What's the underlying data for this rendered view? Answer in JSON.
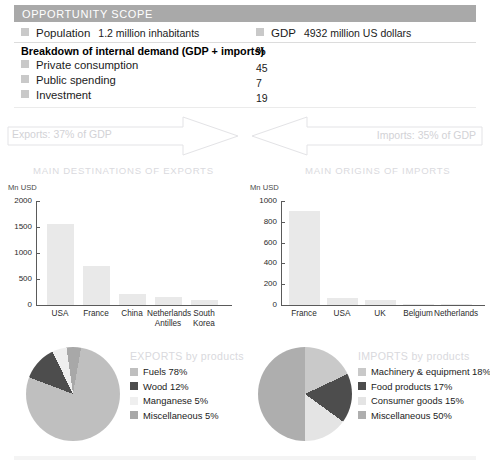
{
  "header": {
    "title": "OPPORTUNITY SCOPE",
    "bar_color": "#a9a9a9"
  },
  "stats": {
    "population": {
      "label": "Population",
      "value": "1.2 million inhabitants"
    },
    "gdp": {
      "label": "GDP",
      "value": "4932 million US dollars"
    }
  },
  "breakdown": {
    "title": "Breakdown of internal demand (GDP + imports)",
    "unit_header": "%",
    "rows": [
      {
        "label": "Private consumption",
        "value": "45"
      },
      {
        "label": "Public spending",
        "value": "7"
      },
      {
        "label": "Investment",
        "value": "19"
      }
    ]
  },
  "flows": {
    "exports_label": "Exports: 37% of GDP",
    "imports_label": "Imports: 35% of GDP"
  },
  "sections": {
    "exports_chart_title": "MAIN DESTINATIONS OF EXPORTS",
    "imports_chart_title": "MAIN ORIGINS OF IMPORTS"
  },
  "chart_data": [
    {
      "type": "bar",
      "title": "MAIN DESTINATIONS OF EXPORTS",
      "xlabel": "",
      "ylabel": "Mn USD",
      "ylim": [
        0,
        2000
      ],
      "yticks": [
        0,
        500,
        1000,
        1500,
        2000
      ],
      "ytick_labels": [
        "0",
        "500",
        "1000",
        "1500",
        "2000"
      ],
      "grid": false,
      "categories": [
        "USA",
        "France",
        "China",
        "Netherlands\nAntilles",
        "South\nKorea"
      ],
      "values": [
        1560,
        745,
        215,
        150,
        100
      ],
      "bar_color": "#e9e9e9"
    },
    {
      "type": "bar",
      "title": "MAIN ORIGINS OF IMPORTS",
      "xlabel": "",
      "ylabel": "Mn USD",
      "ylim": [
        0,
        1000
      ],
      "yticks": [
        0,
        200,
        400,
        600,
        800,
        1000
      ],
      "ytick_labels": [
        "0",
        "200",
        "400",
        "600",
        "800",
        "1000"
      ],
      "grid": false,
      "categories": [
        "France",
        "USA",
        "UK",
        "Belgium",
        "Netherlands"
      ],
      "values": [
        900,
        70,
        45,
        14,
        12
      ],
      "bar_color": "#e9e9e9"
    },
    {
      "type": "pie",
      "title": "EXPORTS by products",
      "labels": [
        "Fuels",
        "Wood",
        "Manganese",
        "Miscellaneous"
      ],
      "legend_entries": [
        "Fuels 78%",
        "Wood 12%",
        "Manganese 5%",
        "Miscellaneous 5%"
      ],
      "values": [
        78,
        12,
        5,
        5
      ],
      "colors": [
        "#bfbfbf",
        "#4d4d4d",
        "#efefef",
        "#a8a8a8"
      ],
      "legend_position": "right"
    },
    {
      "type": "pie",
      "title": "IMPORTS by products",
      "labels": [
        "Machinery & equipment",
        "Food products",
        "Consumer goods",
        "Miscellaneous"
      ],
      "legend_entries": [
        "Machinery & equipment 18%",
        "Food products 17%",
        "Consumer goods 15%",
        "Miscellaneous 50%"
      ],
      "values": [
        18,
        17,
        15,
        50
      ],
      "colors": [
        "#c9c9c9",
        "#4d4d4d",
        "#e4e4e4",
        "#aeaeae"
      ],
      "legend_position": "right"
    }
  ]
}
